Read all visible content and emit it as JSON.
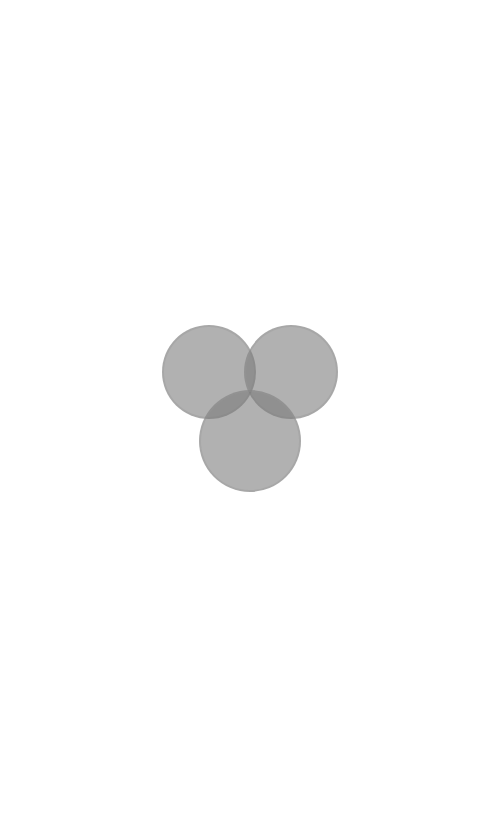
{
  "screen": {
    "background": "#ffffff",
    "state": "loading"
  },
  "logo": {
    "icon": "three-overlapping-circles-icon",
    "fill_color": "#7a7a7a",
    "fill_opacity": 0.78,
    "circles": [
      {
        "name": "left",
        "cx": 209,
        "cy": 372,
        "r": 47
      },
      {
        "name": "right",
        "cx": 291,
        "cy": 372,
        "r": 47
      },
      {
        "name": "bottom",
        "cx": 250,
        "cy": 441,
        "r": 51
      }
    ]
  }
}
